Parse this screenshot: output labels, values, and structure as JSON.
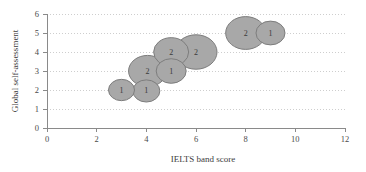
{
  "chart_data": {
    "type": "scatter",
    "subtype": "bubble",
    "title": "",
    "xlabel": "IELTS band score",
    "ylabel": "Global self-assessment",
    "xlim": [
      0,
      12
    ],
    "ylim": [
      0,
      6
    ],
    "xticks": [
      "0",
      "2",
      "4",
      "6",
      "8",
      "10",
      "12"
    ],
    "yticks": [
      "0",
      "1",
      "2",
      "3",
      "4",
      "5",
      "6"
    ],
    "grid": "horizontal-dotted",
    "legend": "none",
    "bubble_fill": "#a8a8a8",
    "bubble_stroke": "#7d7d7d",
    "grid_color": "#c9c9c9",
    "axis_color": "#8a8a8a",
    "points": [
      {
        "x": 3,
        "y": 2,
        "label": "1",
        "size": 1,
        "r": 13
      },
      {
        "x": 4,
        "y": 1.95,
        "label": "1",
        "size": 1,
        "r": 13.5
      },
      {
        "x": 4.05,
        "y": 3,
        "label": "2",
        "size": 2,
        "r": 19
      },
      {
        "x": 5,
        "y": 3,
        "label": "1",
        "size": 1,
        "r": 15
      },
      {
        "x": 5,
        "y": 4,
        "label": "2",
        "size": 2,
        "r": 17.5
      },
      {
        "x": 6,
        "y": 4,
        "label": "2",
        "size": 2,
        "r": 21
      },
      {
        "x": 8,
        "y": 5,
        "label": "2",
        "size": 2,
        "r": 20
      },
      {
        "x": 9,
        "y": 5,
        "label": "1",
        "size": 1,
        "r": 14.5
      }
    ]
  }
}
